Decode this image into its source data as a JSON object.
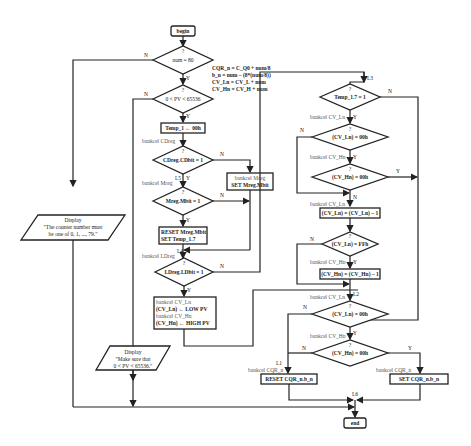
{
  "diagram": {
    "type": "flowchart",
    "terminals": {
      "begin": "begin",
      "end": "end"
    },
    "decisions": [
      {
        "id": "d1",
        "q": "?",
        "label": "num = 80"
      },
      {
        "id": "d2",
        "q": "?",
        "label": "0 < PV < 65536"
      },
      {
        "id": "d3",
        "q": "?",
        "label": "CDreg.CDbit = 1"
      },
      {
        "id": "d4",
        "q": "?",
        "label": "Mreg.Mbit = 1"
      },
      {
        "id": "d5",
        "q": "?",
        "label": "LDreg.LDbit = 1"
      },
      {
        "id": "d6",
        "q": "?",
        "label": "Temp_1.7 = 1"
      },
      {
        "id": "d7",
        "q": "?",
        "label": "(CV_Ln) = 00h"
      },
      {
        "id": "d8",
        "q": "?",
        "label": "(CV_Hn) = 00h"
      },
      {
        "id": "d9",
        "q": "?",
        "label": "(CV_Ln) = FFh"
      },
      {
        "id": "d10",
        "q": "?",
        "label": "(CV_Ln) = 00h"
      },
      {
        "id": "d11",
        "q": "?",
        "label": "(CV_Hn) = 00h"
      }
    ],
    "processes": {
      "temp": "Temp_1 ← 00h",
      "set_mreg_bank": "bankcel Mreg",
      "set_mreg": "SET Mreg.Mbit",
      "reset_mreg": "RESET Mreg.Mbit",
      "set_temp": "SET Temp_1.7",
      "load_l1": "bankcel CV_Ln",
      "load_l2": "(CV_Ln) ← LOW PV",
      "load_l3": "bankcel CV_Hn",
      "load_l4": "(CV_Hn) ← HIGH PV",
      "dec_ln": "(CV_Ln) = (CV_Ln) – 1",
      "dec_hn": "(CV_Hn) = (CV_Hn) – 1",
      "reset_cqr": "RESET CQR_n.b_n",
      "set_cqr": "SET CQR_n.b_n"
    },
    "displays": {
      "d1_l1": "Display",
      "d1_l2": "\"The counter number must",
      "d1_l3": "be one of 0, 1, ..., 79.\"",
      "d2_l1": "Display",
      "d2_l2": "\"Make sure that",
      "d2_l3": "0 < PV < 65536.\""
    },
    "annotations": {
      "eq1": "CQR_n = C_Q0 + num/8",
      "eq2": "b_n = num – (8*(num/8))",
      "eq3": "CV_Ln = CV_L + num",
      "eq4": "CV_Hn = CV_H + num",
      "bank_cdreg": "bankcel CDreg",
      "bank_mreg": "bankcel Mreg",
      "bank_ldreg": "bankcel LDreg",
      "bank_cvln_a": "bankcel CV_Ln",
      "bank_cvhn_a": "bankcel CV_Hn",
      "bank_cvln_b": "bankcel CV_Ln",
      "bank_cvhn_b": "bankcel CV_Hn",
      "bank_cvln_c": "bankcel CV_Ln",
      "bank_cvhn_c": "bankcel CV_Hn",
      "bank_cqr_a": "bankcel CQR_n",
      "bank_cqr_b": "bankcel CQR_n"
    },
    "labels": {
      "L1": "L1",
      "L2": "L2",
      "L3": "L3",
      "L4": "L4",
      "L5": "L5",
      "L6": "L6",
      "Y": "Y",
      "N": "N"
    }
  }
}
